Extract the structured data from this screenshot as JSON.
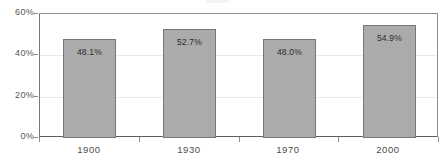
{
  "chart_data": {
    "type": "bar",
    "title": "",
    "xlabel": "",
    "ylabel": "",
    "categories": [
      "1900",
      "1930",
      "1970",
      "2000"
    ],
    "values": [
      48.1,
      52.7,
      48.0,
      54.9
    ],
    "value_labels": [
      "48.1%",
      "52.7%",
      "48.0%",
      "54.9%"
    ],
    "ylim": [
      0,
      60
    ],
    "ytick_values": [
      0,
      20,
      40,
      60
    ],
    "ytick_labels": [
      "0%",
      "20%",
      "40%",
      "60%"
    ],
    "grid": true,
    "legend": false,
    "bar_color": "#ababab",
    "bar_border_color": "#787878",
    "axis_color": "#8e8e8e",
    "gridline_color": "#e9e9e9",
    "label_text_color": "#2b2b2b",
    "tick_text_color": "#565656"
  }
}
